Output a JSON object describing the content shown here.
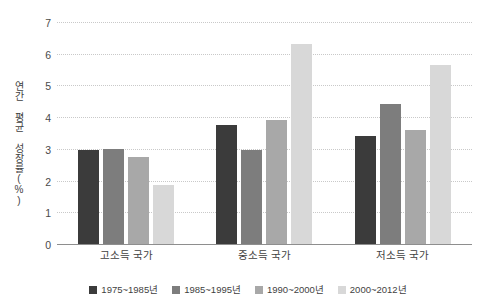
{
  "chart_data": {
    "type": "bar",
    "title": "",
    "xlabel": "",
    "ylabel": "연간 평균 성장률(%)",
    "ylim": [
      0,
      7
    ],
    "yticks": [
      0,
      1,
      2,
      3,
      4,
      5,
      6,
      7
    ],
    "ytick_labels": [
      "0",
      "1",
      "2",
      "3",
      "4",
      "5",
      "6",
      "7"
    ],
    "grid": true,
    "legend_position": "bottom",
    "categories": [
      "고소득 국가",
      "중소득 국가",
      "저소득 국가"
    ],
    "series": [
      {
        "name": "1975~1985년",
        "color": "#3b3b3b",
        "values": [
          2.95,
          3.75,
          3.4
        ]
      },
      {
        "name": "1985~1995년",
        "color": "#7d7d7d",
        "values": [
          3.0,
          2.95,
          4.4
        ]
      },
      {
        "name": "1990~2000년",
        "color": "#a8a8a8",
        "values": [
          2.75,
          3.9,
          3.6
        ]
      },
      {
        "name": "2000~2012년",
        "color": "#d8d8d8",
        "values": [
          1.85,
          6.3,
          5.65
        ]
      }
    ]
  },
  "axis": {
    "y_title": "연간 평균 성장률(%)"
  },
  "colors": {
    "gridline": "#c9c9c9",
    "baseline": "#8e8e8e",
    "text": "#3f3f3f",
    "background": "#ffffff"
  }
}
